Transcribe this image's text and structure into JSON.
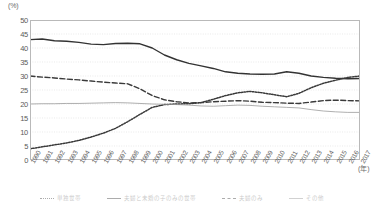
{
  "axes": {
    "y_unit_label": "(%)",
    "x_unit_label": "(年)"
  },
  "legend": {
    "items": [
      {
        "label": "単独世帯",
        "style": "dotted"
      },
      {
        "label": "夫婦と未婚の子のみの世帯",
        "style": "solid"
      },
      {
        "label": "夫婦のみ",
        "style": "dashed"
      },
      {
        "label": "その他",
        "style": "thin"
      }
    ]
  },
  "chart_data": {
    "type": "line",
    "title": "",
    "xlabel": "(年)",
    "ylabel": "(%)",
    "ylim": [
      0,
      50
    ],
    "ytick_step": 5,
    "yticks": [
      0,
      5,
      10,
      15,
      20,
      25,
      30,
      35,
      40,
      45,
      50
    ],
    "grid": true,
    "legend_position": "bottom",
    "categories": [
      "1990",
      "1991",
      "1992",
      "1993",
      "1994",
      "1995",
      "1996",
      "1997",
      "1998",
      "1999",
      "2000",
      "2001",
      "2002",
      "2003",
      "2004",
      "2005",
      "2006",
      "2007",
      "2008",
      "2009",
      "2010",
      "2011",
      "2012",
      "2013",
      "2014",
      "2015",
      "2016",
      "2017"
    ],
    "series": [
      {
        "name": "夫婦と未婚の子のみの世帯",
        "style": "solid",
        "color": "#333333",
        "values": [
          43.0,
          43.2,
          42.6,
          42.4,
          42.0,
          41.4,
          41.2,
          41.6,
          41.7,
          41.5,
          40.0,
          37.5,
          35.8,
          34.5,
          33.6,
          32.7,
          31.5,
          31.0,
          30.7,
          30.6,
          30.7,
          31.5,
          31.0,
          30.0,
          29.5,
          29.2,
          29.0,
          29.1
        ]
      },
      {
        "name": "単独世帯",
        "style": "dotted",
        "color": "#3a3a3a",
        "values": [
          4.0,
          4.7,
          5.4,
          6.1,
          7.0,
          8.2,
          9.6,
          11.3,
          13.7,
          16.3,
          18.8,
          19.8,
          20.0,
          20.1,
          20.5,
          21.7,
          23.0,
          24.0,
          24.5,
          24.0,
          23.3,
          22.6,
          23.8,
          25.8,
          27.4,
          28.5,
          29.5,
          30.0
        ]
      },
      {
        "name": "夫婦のみ",
        "style": "dashed",
        "color": "#3a3a3a",
        "values": [
          30.0,
          29.6,
          29.3,
          28.9,
          28.6,
          28.2,
          27.8,
          27.5,
          27.2,
          25.4,
          23.0,
          21.5,
          20.8,
          20.4,
          20.5,
          20.8,
          21.0,
          21.2,
          21.0,
          20.6,
          20.5,
          20.3,
          20.2,
          20.7,
          21.2,
          21.4,
          21.2,
          21.1
        ]
      },
      {
        "name": "その他",
        "style": "thin",
        "color": "#9b9b9b",
        "values": [
          20.0,
          20.1,
          20.1,
          20.2,
          20.2,
          20.3,
          20.4,
          20.5,
          20.4,
          20.2,
          20.0,
          19.9,
          19.8,
          19.6,
          19.3,
          19.2,
          19.4,
          19.6,
          19.5,
          19.2,
          19.0,
          18.8,
          18.6,
          18.0,
          17.5,
          17.2,
          17.0,
          17.0
        ]
      }
    ]
  }
}
